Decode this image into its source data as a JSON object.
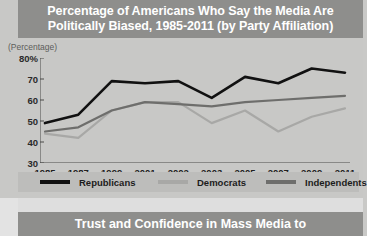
{
  "panel1": {
    "title": "Percentage of Americans Who Say the Media Are Politically Biased, 1985-2011 (by Party Affiliation)",
    "title_line1": "Percentage of Americans Who Say the Media Are",
    "title_line2": "Politically Biased, 1985-2011 (by Party Affiliation)",
    "axis_note": "(Percentage)"
  },
  "panel2": {
    "title": "Trust and Confidence in Mass Media to"
  },
  "legend": {
    "items": [
      {
        "label": "Republicans",
        "color": "#111111"
      },
      {
        "label": "Democrats",
        "color": "#a8a8a6"
      },
      {
        "label": "Independents",
        "color": "#6e6e6c"
      }
    ]
  },
  "chart_data": {
    "type": "line",
    "title": "Percentage of Americans Who Say the Media Are Politically Biased, 1985-2011 (by Party Affiliation)",
    "xlabel": "",
    "ylabel": "(Percentage)",
    "ylim": [
      30,
      80
    ],
    "yticks": [
      "30",
      "40",
      "50",
      "60",
      "70",
      "80%"
    ],
    "ytick_values": [
      30,
      40,
      50,
      60,
      70,
      80
    ],
    "grid": false,
    "legend_position": "bottom",
    "categories": [
      "1985",
      "1987",
      "1999",
      "2001",
      "2002",
      "2003",
      "2005",
      "2007",
      "2009",
      "2011"
    ],
    "series": [
      {
        "name": "Republicans",
        "color": "#111111",
        "values": [
          49,
          53,
          69,
          68,
          69,
          61,
          71,
          68,
          75,
          73
        ]
      },
      {
        "name": "Democrats",
        "color": "#a8a8a6",
        "values": [
          44,
          42,
          55,
          59,
          59,
          49,
          55,
          45,
          52,
          56
        ]
      },
      {
        "name": "Independents",
        "color": "#6e6e6c",
        "values": [
          45,
          47,
          55,
          59,
          58,
          57,
          59,
          60,
          61,
          62
        ]
      }
    ]
  }
}
